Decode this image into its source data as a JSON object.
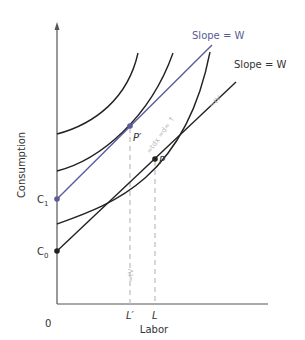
{
  "figure": {
    "axes": {
      "x_label": "Labor",
      "y_label": "Consumption",
      "origin_label": "0"
    },
    "y_ticks": [
      {
        "label": "C",
        "sub": "1",
        "note": "intercept of blue budget line"
      },
      {
        "label": "C",
        "sub": "0",
        "note": "intercept of black budget line"
      }
    ],
    "x_ticks": [
      {
        "label": "L′"
      },
      {
        "label": "L"
      }
    ],
    "points": [
      {
        "label": "P′",
        "color": "#5a5c9a"
      },
      {
        "label": "P",
        "color": "#222222"
      }
    ],
    "lines": [
      {
        "label": "Slope = W",
        "color": "#5a5c9a"
      },
      {
        "label": "Slope = W",
        "color": "#222222"
      }
    ],
    "faint_annotations": [
      "≈tV",
      "≈tdx ≈d≈ ↑",
      "≈tV"
    ],
    "colors": {
      "axis": "#555555",
      "curve": "#222222",
      "blue_line": "#5a5c9a",
      "dashed": "#bbbbbb",
      "text": "#333333"
    }
  }
}
